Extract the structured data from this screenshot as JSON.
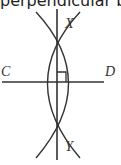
{
  "title": "perpendicular bisector",
  "labels": {
    "x": "X",
    "y": "Y",
    "c": "C",
    "d": "D"
  },
  "colors": {
    "stroke": "#333333",
    "background": "#ffffff"
  }
}
